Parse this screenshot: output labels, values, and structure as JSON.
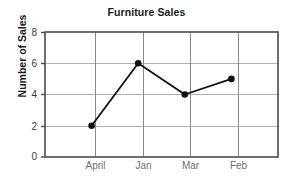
{
  "chart_data": {
    "type": "line",
    "title": "Furniture Sales",
    "xlabel": "",
    "ylabel": "Number of Sales",
    "categories": [
      "April",
      "Jan",
      "Mar",
      "Feb"
    ],
    "values": [
      2,
      6,
      4,
      5
    ],
    "ylim": [
      0,
      8
    ],
    "yticks": [
      0,
      2,
      4,
      6,
      8
    ],
    "grid": true,
    "legend": false,
    "series_color": "#111111",
    "marker": "filled-circle",
    "grid_color": "#b0b0b0",
    "frame_color": "#4a4a4a",
    "background": "#ffffff"
  }
}
